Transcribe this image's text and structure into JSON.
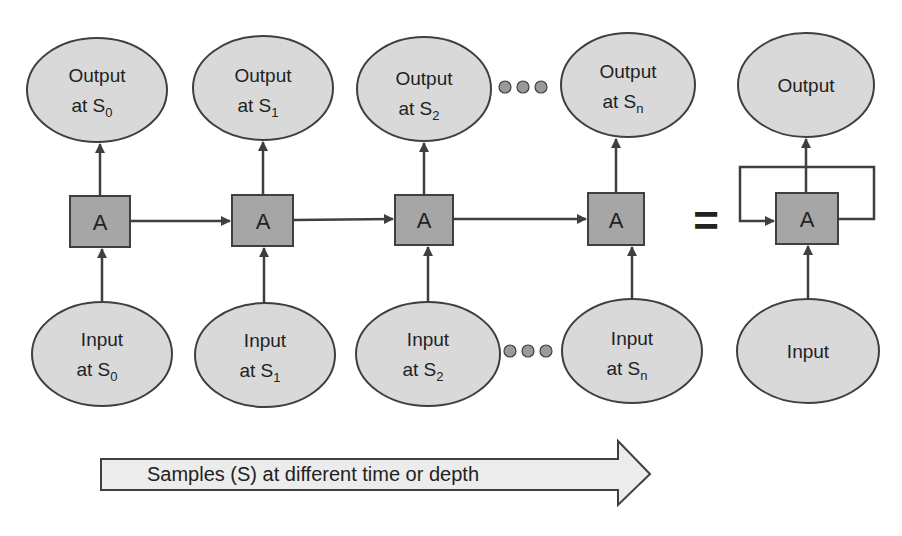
{
  "diagram": {
    "type": "unrolled-recurrent-network",
    "colors": {
      "node_fill": "#d9d9d9",
      "box_fill": "#a6a6a6",
      "stroke": "#3f3f3f",
      "dot_fill": "#9a9a9a",
      "banner_fill": "#ececec"
    },
    "outputs": [
      {
        "line1": "Output",
        "line2": "at S",
        "sub": "0"
      },
      {
        "line1": "Output",
        "line2": "at S",
        "sub": "1"
      },
      {
        "line1": "Output",
        "line2": "at S",
        "sub": "2"
      },
      {
        "line1": "Output",
        "line2": "at S",
        "sub": "n"
      }
    ],
    "inputs": [
      {
        "line1": "Input",
        "line2": "at S",
        "sub": "0"
      },
      {
        "line1": "Input",
        "line2": "at S",
        "sub": "1"
      },
      {
        "line1": "Input",
        "line2": "at S",
        "sub": "2"
      },
      {
        "line1": "Input",
        "line2": "at S",
        "sub": "n"
      }
    ],
    "cell_label": "A",
    "equals_sign": "=",
    "rolled": {
      "output_label": "Output",
      "cell_label": "A",
      "input_label": "Input"
    },
    "ellipsis_icon": "three-dots",
    "banner_text": "Samples (S) at different time or depth"
  }
}
